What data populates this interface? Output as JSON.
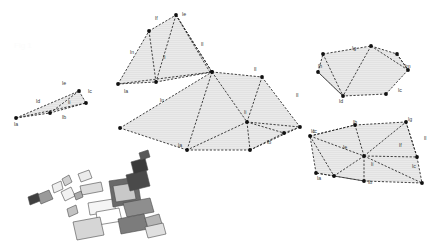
{
  "figure": {
    "title_watermark": "Fig 1",
    "background_color": "#ffffff",
    "fill_color": "#e9e9e9",
    "stroke_color": "#2b2b2b",
    "vertex_color": "#111111",
    "label_color": "#3a3a3a"
  },
  "clusters": [
    {
      "id": "cluster-left-quad",
      "name": "left-quadrilateral",
      "polygons": [
        {
          "points": "16,118 45,110 79,91 86,103 50,113"
        },
        {
          "points": "16,118 50,113 86,103 79,91"
        }
      ],
      "edges": [
        "16,118 79,91",
        "16,118 86,103",
        "79,91 86,103",
        "16,118 50,113",
        "50,113 86,103",
        "50,113 79,91"
      ],
      "vertices": [
        "16,118",
        "50,113",
        "79,91",
        "86,103"
      ],
      "labels": [
        {
          "text": "la",
          "x": 14,
          "y": 126
        },
        {
          "text": "lb",
          "x": 62,
          "y": 119
        },
        {
          "text": "lc",
          "x": 88,
          "y": 93
        },
        {
          "text": "ld",
          "x": 36,
          "y": 103
        },
        {
          "text": "le",
          "x": 62,
          "y": 85
        },
        {
          "text": "li",
          "x": 68,
          "y": 104
        }
      ]
    },
    {
      "id": "cluster-upper-middle",
      "name": "upper-middle-polygon",
      "polygons": [
        {
          "points": "118,84 149,31 176,15 212,72 156,82"
        }
      ],
      "edges": [
        "118,84 149,31",
        "149,31 176,15",
        "176,15 212,72",
        "212,72 118,84",
        "149,31 156,82",
        "176,15 156,82",
        "176,15 212,72",
        "118,84 156,82",
        "156,82 212,72",
        "176,15 211,74"
      ],
      "vertices": [
        "118,84",
        "149,31",
        "176,15",
        "212,72",
        "156,82"
      ],
      "labels": [
        {
          "text": "la",
          "x": 124,
          "y": 93
        },
        {
          "text": "lf",
          "x": 155,
          "y": 20
        },
        {
          "text": "le",
          "x": 182,
          "y": 16
        },
        {
          "text": "ln",
          "x": 130,
          "y": 54
        },
        {
          "text": "li",
          "x": 163,
          "y": 59
        },
        {
          "text": "ll",
          "x": 201,
          "y": 46
        },
        {
          "text": "lb",
          "x": 219,
          "y": 83
        }
      ]
    },
    {
      "id": "cluster-central-large",
      "name": "central-large-polygon",
      "polygons": [
        {
          "points": "120,128 212,72 262,77 300,127 250,150 187,150"
        }
      ],
      "edges": [
        "120,128 212,72",
        "212,72 262,77",
        "262,77 300,127",
        "300,127 250,150",
        "250,150 187,150",
        "187,150 120,128",
        "212,72 187,150",
        "212,72 247,122",
        "247,122 187,150",
        "247,122 262,77",
        "247,122 300,127",
        "247,122 250,150",
        "247,122 284,133",
        "284,133 300,127",
        "250,150 284,133"
      ],
      "vertices": [
        "120,128",
        "212,72",
        "262,77",
        "300,127",
        "250,150",
        "187,150",
        "247,122",
        "284,133"
      ],
      "labels": [
        {
          "text": "ln",
          "x": 160,
          "y": 102
        },
        {
          "text": "la",
          "x": 178,
          "y": 147
        },
        {
          "text": "ll",
          "x": 254,
          "y": 71
        },
        {
          "text": "li",
          "x": 244,
          "y": 114
        },
        {
          "text": "ll",
          "x": 296,
          "y": 97
        },
        {
          "text": "lb",
          "x": 267,
          "y": 144
        },
        {
          "text": "lc",
          "x": 313,
          "y": 133
        }
      ]
    },
    {
      "id": "cluster-top-right",
      "name": "top-right-polygon",
      "polygons": [
        {
          "points": "323,54 371,46 397,54 408,70 386,94 343,96 318,72"
        }
      ],
      "edges": [
        "323,54 371,46",
        "371,46 397,54",
        "397,54 408,70",
        "408,70 386,94",
        "386,94 343,96",
        "343,96 318,72",
        "318,72 323,54",
        "323,54 343,96",
        "371,46 343,96",
        "397,54 408,70",
        "371,46 408,70",
        "318,72 343,96"
      ],
      "vertices": [
        "323,54",
        "371,46",
        "397,54",
        "408,70",
        "386,94",
        "343,96",
        "318,72"
      ],
      "labels": [
        {
          "text": "lg",
          "x": 352,
          "y": 50
        },
        {
          "text": "lh",
          "x": 318,
          "y": 68
        },
        {
          "text": "lm",
          "x": 405,
          "y": 68
        },
        {
          "text": "lc",
          "x": 398,
          "y": 92
        },
        {
          "text": "ld",
          "x": 339,
          "y": 103
        }
      ]
    },
    {
      "id": "cluster-bottom-right",
      "name": "bottom-right-polygon",
      "polygons": [
        {
          "points": "310,136 355,125 406,122 417,157 422,183 364,181 316,173"
        }
      ],
      "edges": [
        "310,136 355,125",
        "355,125 406,122",
        "406,122 417,157",
        "417,157 422,183",
        "422,183 364,181",
        "364,181 316,173",
        "316,173 310,136",
        "310,136 355,125",
        "310,136 364,156",
        "364,156 355,125",
        "364,156 406,122",
        "364,156 417,157",
        "364,156 422,183",
        "364,156 364,181",
        "364,156 334,176",
        "334,176 316,173",
        "334,176 364,181",
        "310,136 334,176",
        "406,122 417,157"
      ],
      "vertices": [
        "310,136",
        "355,125",
        "406,122",
        "417,157",
        "422,183",
        "364,181",
        "316,173",
        "364,156",
        "334,176"
      ],
      "labels": [
        {
          "text": "lh",
          "x": 353,
          "y": 124
        },
        {
          "text": "lg",
          "x": 408,
          "y": 121
        },
        {
          "text": "ll",
          "x": 424,
          "y": 140
        },
        {
          "text": "lf",
          "x": 399,
          "y": 147
        },
        {
          "text": "lc",
          "x": 412,
          "y": 168
        },
        {
          "text": "lc",
          "x": 311,
          "y": 133
        },
        {
          "text": "le",
          "x": 343,
          "y": 149
        },
        {
          "text": "li",
          "x": 371,
          "y": 166
        },
        {
          "text": "la",
          "x": 317,
          "y": 180
        },
        {
          "text": "lb",
          "x": 368,
          "y": 184
        }
      ]
    }
  ],
  "fragments": {
    "name": "scattered-fragment-cluster",
    "shapes": [
      {
        "points": "37,195 49,190 53,199 41,204",
        "fill": "#9a9a9a"
      },
      {
        "points": "28,197 38,193 40,201 30,205",
        "fill": "#3f3f3f"
      },
      {
        "points": "61,192 71,187 75,196 65,201",
        "fill": "#f2f2f2"
      },
      {
        "points": "62,179 69,175 72,182 65,186",
        "fill": "#cfcfcf"
      },
      {
        "points": "80,186 101,182 103,191 82,195",
        "fill": "#dcdcdc"
      },
      {
        "points": "78,174 89,170 92,178 81,182",
        "fill": "#ececec"
      },
      {
        "points": "88,203 113,199 116,211 90,215",
        "fill": "#f5f5f5"
      },
      {
        "points": "96,212 119,208 122,221 98,225",
        "fill": "#ffffff"
      },
      {
        "points": "109,181 137,177 141,202 113,207",
        "fill": "#6a6a6a"
      },
      {
        "points": "113,186 133,183 136,199 116,202",
        "fill": "#c8c8c8"
      },
      {
        "points": "126,175 146,170 150,186 130,191",
        "fill": "#4a4a4a"
      },
      {
        "points": "131,162 145,158 148,170 134,174",
        "fill": "#3a3a3a"
      },
      {
        "points": "139,153 148,150 150,157 141,160",
        "fill": "#595959"
      },
      {
        "points": "123,203 150,198 154,212 127,217",
        "fill": "#8e8e8e"
      },
      {
        "points": "118,219 144,214 148,229 121,234",
        "fill": "#7c7c7c"
      },
      {
        "points": "145,218 159,214 162,224 148,228",
        "fill": "#b5b5b5"
      },
      {
        "points": "145,227 163,223 166,234 148,238",
        "fill": "#e0e0e0"
      },
      {
        "points": "73,222 100,217 104,235 77,240",
        "fill": "#d6d6d6"
      },
      {
        "points": "74,194 81,191 83,197 76,200",
        "fill": "#aaaaaa"
      },
      {
        "points": "67,209 76,205 78,213 69,217",
        "fill": "#c2c2c2"
      },
      {
        "points": "52,185 61,181 63,189 54,193",
        "fill": "#efefef"
      }
    ]
  }
}
